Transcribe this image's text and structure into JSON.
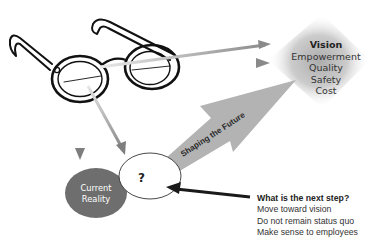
{
  "diagram": {
    "vision": {
      "title": "Vision",
      "items": [
        "Empowerment",
        "Quality",
        "Safety",
        "Cost"
      ]
    },
    "current_reality": {
      "line1": "Current",
      "line2": "Reality"
    },
    "unknown_node": {
      "label": "?"
    },
    "big_arrow": {
      "label": "Shaping the Future"
    },
    "next_step": {
      "title": "What is the next step?",
      "items": [
        "Move toward vision",
        "Do not remain status quo",
        "Make sense to employees"
      ]
    },
    "colors": {
      "reality_fill": "#6e6e6e",
      "big_arrow_fill": "#b3b3b3",
      "thin_arrow": "#9a9a9a",
      "vision_glow": "#bdbdbd",
      "dark_arrow": "#1a1a1a"
    }
  }
}
